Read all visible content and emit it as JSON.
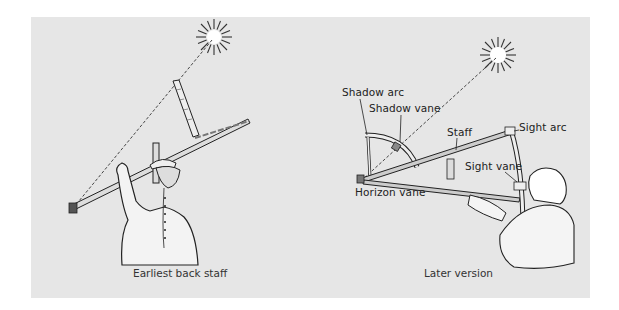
{
  "figures": [
    {
      "id": "earliest",
      "caption": "Earliest back staff"
    },
    {
      "id": "later",
      "caption": "Later version",
      "labels": [
        {
          "text": "Shadow arc"
        },
        {
          "text": "Shadow vane"
        },
        {
          "text": "Staff"
        },
        {
          "text": "Sight arc"
        },
        {
          "text": "Sight vane"
        },
        {
          "text": "Horizon vane"
        }
      ]
    }
  ],
  "colors": {
    "panel": "#e6e6e6",
    "ink": "#222222",
    "sun": "#ffffff"
  }
}
